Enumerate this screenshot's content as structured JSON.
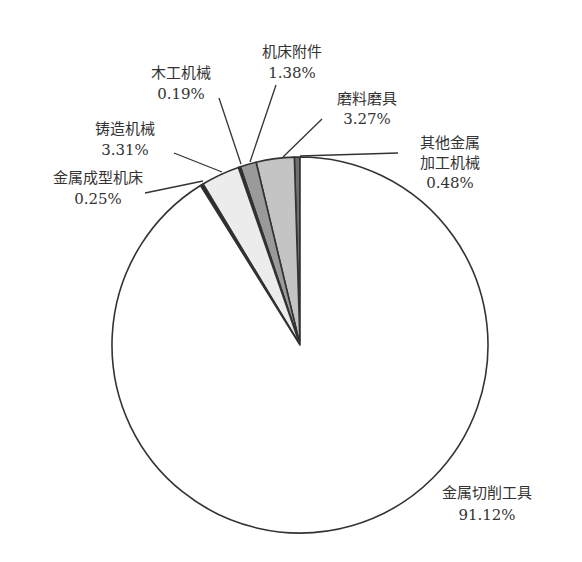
{
  "chart_data": {
    "type": "pie",
    "title": "",
    "start_angle": "12 o'clock, counterclockwise",
    "slices": [
      {
        "name": "其他金属加工机械",
        "label_lines": [
          "其他金属",
          "加工机械",
          "0.48%"
        ],
        "value": 0.48,
        "color": "#6f6f6f"
      },
      {
        "name": "磨料磨具",
        "label_lines": [
          "磨料磨具",
          "3.27%"
        ],
        "value": 3.27,
        "color": "#c4c4c4"
      },
      {
        "name": "机床附件",
        "label_lines": [
          "机床附件",
          "1.38%"
        ],
        "value": 1.38,
        "color": "#9a9a9a"
      },
      {
        "name": "木工机械",
        "label_lines": [
          "木工机械",
          "0.19%"
        ],
        "value": 0.19,
        "color": "#222222"
      },
      {
        "name": "铸造机械",
        "label_lines": [
          "铸造机械",
          "3.31%"
        ],
        "value": 3.31,
        "color": "#ececec"
      },
      {
        "name": "金属成型机床",
        "label_lines": [
          "金属成型机床",
          "0.25%"
        ],
        "value": 0.25,
        "color": "#2a2a2a"
      },
      {
        "name": "金属切削工具",
        "label_lines": [
          "金属切削工具",
          "91.12%"
        ],
        "value": 91.12,
        "color": "#ffffff"
      }
    ],
    "legend": "none (callout labels with leader lines)"
  },
  "labels": {
    "other_metal": {
      "line1": "其他金属",
      "line2": "加工机械",
      "pct": "0.48%"
    },
    "abrasives": {
      "line1": "磨料磨具",
      "pct": "3.27%"
    },
    "machine_accessories": {
      "line1": "机床附件",
      "pct": "1.38%"
    },
    "woodworking": {
      "line1": "木工机械",
      "pct": "0.19%"
    },
    "casting": {
      "line1": "铸造机械",
      "pct": "3.31%"
    },
    "metal_forming": {
      "line1": "金属成型机床",
      "pct": "0.25%"
    },
    "metal_cutting": {
      "line1": "金属切削工具",
      "pct": "91.12%"
    }
  }
}
